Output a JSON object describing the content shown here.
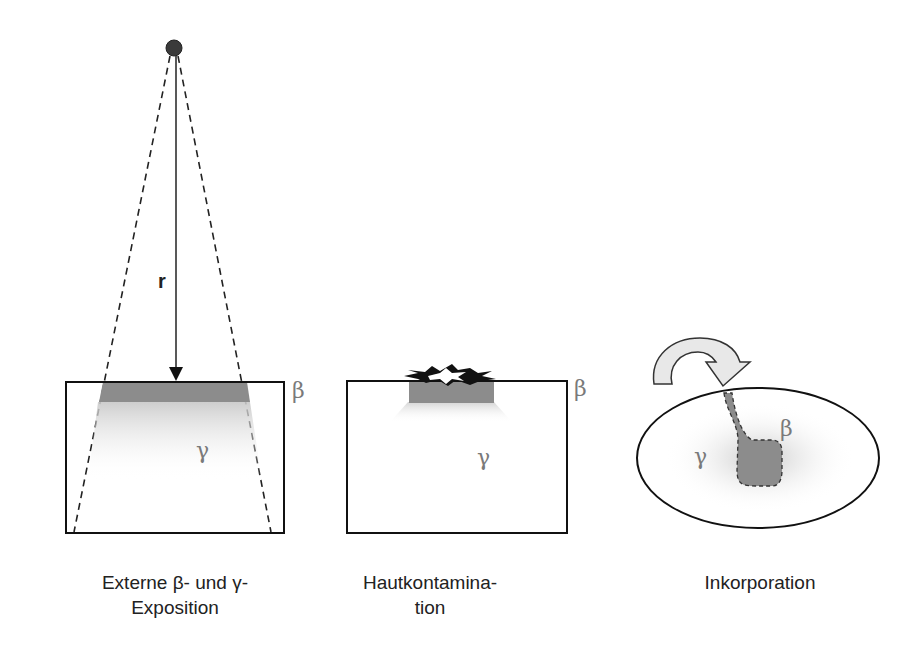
{
  "panels": [
    {
      "id": "external",
      "distance_label": "r",
      "beta_label": "β",
      "gamma_label": "γ",
      "caption_line1": "Externe β- und γ-",
      "caption_line2": "Exposition"
    },
    {
      "id": "skin",
      "beta_label": "β",
      "gamma_label": "γ",
      "caption_line1": "Hautkontamina-",
      "caption_line2": "tion"
    },
    {
      "id": "incorporation",
      "beta_label": "β",
      "gamma_label": "γ",
      "caption_line1": "Inkorporation"
    }
  ],
  "colors": {
    "outline": "#111111",
    "beta_fill": "#8c8c8c",
    "greek_text": "#7a7a7a",
    "arrow_fill": "#e8e8e8"
  }
}
